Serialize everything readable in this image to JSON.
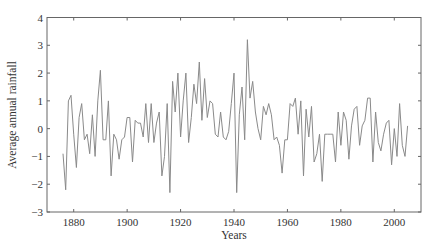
{
  "chart_data": {
    "type": "line",
    "title": "",
    "xlabel": "Years",
    "ylabel": "Average annual rainfall",
    "xlim": [
      1870,
      2010
    ],
    "ylim": [
      -3,
      4
    ],
    "grid": false,
    "legend": null,
    "line_color": "#8a8a8a",
    "axis_color": "#555555",
    "xticks": [
      1880,
      1900,
      1920,
      1940,
      1960,
      1980,
      2000
    ],
    "yticks": [
      -3,
      -2,
      -1,
      0,
      1,
      2,
      3,
      4
    ],
    "series": [
      {
        "name": "Average annual rainfall",
        "x": [
          1876,
          1877,
          1878,
          1879,
          1880,
          1881,
          1882,
          1883,
          1884,
          1885,
          1886,
          1887,
          1888,
          1889,
          1890,
          1891,
          1892,
          1893,
          1894,
          1895,
          1896,
          1897,
          1898,
          1899,
          1900,
          1901,
          1902,
          1903,
          1904,
          1905,
          1906,
          1907,
          1908,
          1909,
          1910,
          1911,
          1912,
          1913,
          1914,
          1915,
          1916,
          1917,
          1918,
          1919,
          1920,
          1921,
          1922,
          1923,
          1924,
          1925,
          1926,
          1927,
          1928,
          1929,
          1930,
          1931,
          1932,
          1933,
          1934,
          1935,
          1936,
          1937,
          1938,
          1939,
          1940,
          1941,
          1942,
          1943,
          1944,
          1945,
          1946,
          1947,
          1948,
          1949,
          1950,
          1951,
          1952,
          1953,
          1954,
          1955,
          1956,
          1957,
          1958,
          1959,
          1960,
          1961,
          1962,
          1963,
          1964,
          1965,
          1966,
          1967,
          1968,
          1969,
          1970,
          1971,
          1972,
          1973,
          1974,
          1975,
          1976,
          1977,
          1978,
          1979,
          1980,
          1981,
          1982,
          1983,
          1984,
          1985,
          1986,
          1987,
          1988,
          1989,
          1990,
          1991,
          1992,
          1993,
          1994,
          1995,
          1996,
          1997,
          1998,
          1999,
          2000,
          2001,
          2002,
          2003,
          2004,
          2005
        ],
        "values": [
          -0.9,
          -2.2,
          1.0,
          1.2,
          -0.2,
          -1.4,
          0.4,
          0.9,
          -0.4,
          -0.2,
          -0.9,
          0.5,
          -1.0,
          1.0,
          2.1,
          -0.4,
          -0.4,
          1.0,
          -1.7,
          -0.2,
          -0.4,
          -1.1,
          -0.4,
          -0.3,
          0.4,
          0.4,
          -1.2,
          0.3,
          0.2,
          0.2,
          -0.3,
          0.9,
          -0.5,
          0.9,
          -0.5,
          0.2,
          0.6,
          -1.7,
          -1.0,
          0.9,
          -2.3,
          1.7,
          0.6,
          2.0,
          -0.3,
          1.0,
          2.0,
          -0.5,
          0.4,
          1.6,
          0.9,
          2.4,
          0.3,
          1.8,
          0.4,
          1.0,
          0.9,
          -0.2,
          -0.3,
          0.6,
          -0.3,
          -0.4,
          -0.1,
          0.9,
          2.0,
          -2.3,
          0.5,
          1.5,
          -0.4,
          3.2,
          1.1,
          1.7,
          0.6,
          0.0,
          -0.4,
          0.8,
          0.5,
          0.9,
          0.5,
          -0.4,
          -0.3,
          -0.6,
          -1.6,
          -0.4,
          -0.4,
          0.9,
          0.8,
          1.1,
          -0.2,
          1.0,
          -1.7,
          0.7,
          -0.3,
          0.8,
          -1.2,
          -0.9,
          -0.2,
          -1.9,
          -0.2,
          -0.2,
          -0.2,
          -0.2,
          -1.2,
          0.6,
          -0.6,
          0.6,
          0.3,
          -1.1,
          0.1,
          0.7,
          0.8,
          -0.6,
          0.1,
          0.3,
          1.1,
          1.1,
          -1.2,
          0.6,
          -0.5,
          -0.8,
          -0.2,
          0.2,
          0.3,
          -1.3,
          0.0,
          -1.0,
          0.9,
          -0.6,
          -1.0,
          0.1
        ]
      }
    ]
  }
}
